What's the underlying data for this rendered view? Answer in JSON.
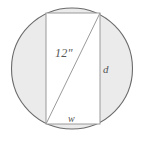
{
  "figure": {
    "type": "geometry-diagram",
    "canvas": {
      "width": 144,
      "height": 145
    },
    "circle": {
      "name": "outer-circle",
      "center_x": 72,
      "center_y": 68.5,
      "radius": 61,
      "fill_color": "#ebebeb",
      "stroke_color": "#6b6b6b",
      "stroke_width": 1.1
    },
    "rectangle": {
      "name": "inscribed-rectangle",
      "left": 46,
      "top": 13,
      "right": 100,
      "bottom": 124,
      "width": 54,
      "height": 111,
      "fill_color": "#ffffff",
      "stroke_color": "#9a9a9a",
      "stroke_width": 1
    },
    "diagonal": {
      "name": "rectangle-diagonal",
      "x1": 46,
      "y1": 124,
      "x2": 100,
      "y2": 13,
      "stroke_color": "#9a9a9a",
      "stroke_width": 1
    },
    "labels": {
      "diagonal": "12\"",
      "depth": "d",
      "width": "w"
    }
  }
}
